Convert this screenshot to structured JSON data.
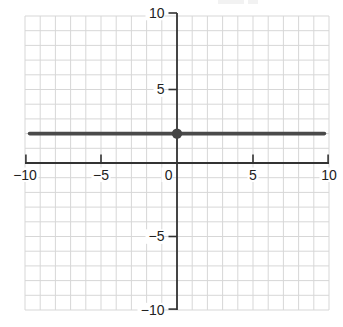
{
  "chart_data": {
    "type": "line",
    "title": "",
    "xlabel": "",
    "ylabel": "",
    "x_range": [
      -10,
      10
    ],
    "y_range": [
      -10,
      10
    ],
    "grid": true,
    "grid_step": 1,
    "x_ticks": [
      -10,
      -5,
      0,
      5,
      10
    ],
    "x_tick_labels": [
      "−10",
      "−5",
      "0",
      "5",
      "10"
    ],
    "y_ticks": [
      10,
      5,
      -5,
      -10
    ],
    "y_tick_labels": [
      "10",
      "5",
      "−5",
      "−10"
    ],
    "series": [
      {
        "name": "horizontal-line-y-equals-2",
        "equation_value": 2,
        "points": [
          [
            -9.7,
            2
          ],
          [
            9.7,
            2
          ]
        ],
        "color": "#4a4a4a",
        "width": 3.6
      }
    ],
    "markers": [
      {
        "name": "point-0-2",
        "x": 0,
        "y": 2,
        "radius": 5.2,
        "color": "#454545"
      }
    ],
    "colors": {
      "background": "#ffffff",
      "grid": "#d7d7d7",
      "axis": "#333333",
      "tick": "#333333",
      "label": "#222222"
    },
    "legend": null
  }
}
